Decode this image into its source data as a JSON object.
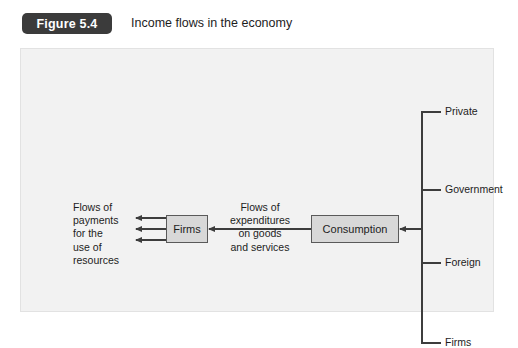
{
  "header": {
    "badge": "Figure 5.4",
    "title": "Income flows in the economy"
  },
  "diagram": {
    "nodes": [
      {
        "id": "firms",
        "label": "Firms"
      },
      {
        "id": "consumption",
        "label": "Consumption"
      }
    ],
    "annotations": [
      {
        "id": "payments",
        "text": "Flows of\npayments\nfor the\nuse of\nresources"
      },
      {
        "id": "expenditures",
        "text": "Flows of\nexpenditures\non goods\nand services"
      }
    ],
    "bracket": {
      "items": [
        {
          "label": "Private"
        },
        {
          "label": "Government"
        },
        {
          "label": "Foreign"
        },
        {
          "label": "Firms"
        }
      ]
    },
    "colors": {
      "panel_background": "#f2f2f2",
      "node_fill": "#d8d8d8",
      "node_stroke": "#5a5a5a",
      "line": "#3d3d3d",
      "badge_background": "#3b3b3b",
      "text": "#1d1d1d"
    }
  }
}
